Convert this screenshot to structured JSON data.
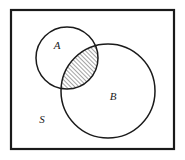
{
  "figure": {
    "name": "venn-diagram-two-sets-intersection-shaded",
    "width": 185,
    "height": 160,
    "background_color": "#ffffff",
    "stroke_color": "#1a1a1a",
    "hatch_color": "#1a1a1a"
  },
  "universe": {
    "label": "S",
    "label_x": 42,
    "label_y": 120,
    "rect": {
      "x": 11,
      "y": 10,
      "width": 163,
      "height": 139
    },
    "stroke_width": 2.2
  },
  "sets": [
    {
      "label": "A",
      "label_x": 57,
      "label_y": 46,
      "cx": 67,
      "cy": 58,
      "r": 31,
      "stroke_width": 1.5
    },
    {
      "label": "B",
      "label_x": 113,
      "label_y": 97,
      "cx": 108,
      "cy": 91,
      "r": 47,
      "stroke_width": 1.5
    }
  ],
  "shaded_region": {
    "name": "A-intersect-B",
    "fill_style": "diagonal-hatch",
    "hatch_angle_degrees": 45,
    "hatch_spacing_px": 3,
    "hatch_line_width": 0.8
  }
}
